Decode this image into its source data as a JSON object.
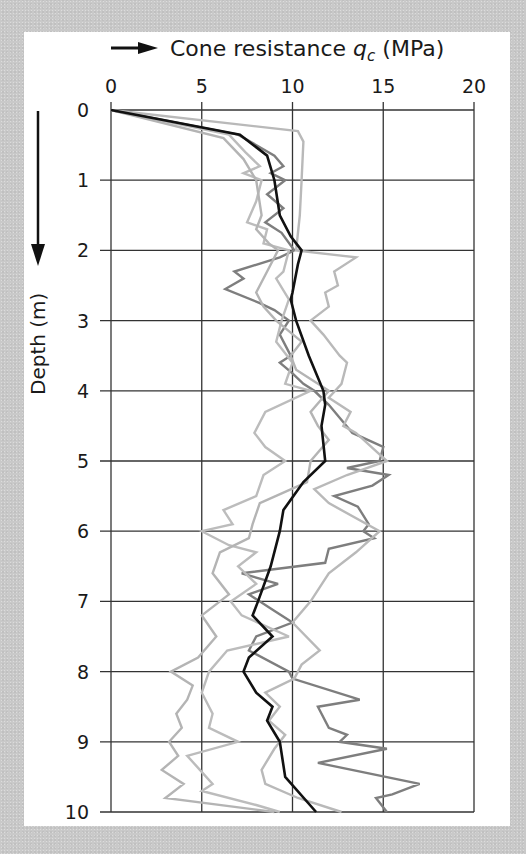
{
  "chart_data": {
    "type": "line",
    "title": "Cone resistance qc (MPa)",
    "title_parts": {
      "prefix": "Cone resistance ",
      "symbol": "q",
      "subscript": "c",
      "unit": " (MPa)"
    },
    "xlabel": "Cone resistance qc (MPa)",
    "ylabel": "Depth (m)",
    "x_axis_position": "top",
    "y_axis_inverted": true,
    "xlim": [
      0,
      20
    ],
    "ylim": [
      0,
      10
    ],
    "x_ticks": [
      "0",
      "5",
      "10",
      "15",
      "20"
    ],
    "y_ticks": [
      "0",
      "1",
      "2",
      "3",
      "4",
      "5",
      "6",
      "7",
      "8",
      "9",
      "10"
    ],
    "grid": true,
    "legend": null,
    "series": [
      {
        "name": "Mean profile",
        "color": "#111111",
        "width": 2.6,
        "points": [
          [
            0,
            0
          ],
          [
            7.1,
            0.35
          ],
          [
            8.6,
            0.65
          ],
          [
            9.0,
            1.0
          ],
          [
            9.3,
            1.5
          ],
          [
            9.9,
            1.8
          ],
          [
            10.5,
            2.0
          ],
          [
            10.3,
            2.2
          ],
          [
            10.0,
            2.6
          ],
          [
            9.9,
            2.7
          ],
          [
            10.2,
            3.0
          ],
          [
            10.9,
            3.5
          ],
          [
            11.7,
            4.0
          ],
          [
            11.8,
            4.2
          ],
          [
            11.6,
            4.5
          ],
          [
            11.8,
            5.0
          ],
          [
            10.6,
            5.3
          ],
          [
            9.5,
            5.7
          ],
          [
            9.3,
            6.0
          ],
          [
            8.8,
            6.5
          ],
          [
            8.1,
            7.0
          ],
          [
            7.8,
            7.2
          ],
          [
            8.9,
            7.5
          ],
          [
            7.6,
            7.8
          ],
          [
            7.3,
            8.0
          ],
          [
            8.0,
            8.3
          ],
          [
            8.9,
            8.5
          ],
          [
            8.6,
            8.7
          ],
          [
            9.3,
            9.0
          ],
          [
            9.6,
            9.5
          ],
          [
            11.3,
            10.0
          ]
        ]
      },
      {
        "name": "CPT profile A (dark grey)",
        "color": "#7e7e7e",
        "width": 2.4,
        "points": [
          [
            0,
            0
          ],
          [
            7.0,
            0.35
          ],
          [
            9.0,
            0.65
          ],
          [
            9.5,
            0.8
          ],
          [
            8.8,
            0.9
          ],
          [
            9.6,
            1.0
          ],
          [
            8.6,
            1.2
          ],
          [
            9.5,
            1.4
          ],
          [
            8.5,
            1.6
          ],
          [
            9.4,
            1.75
          ],
          [
            10.1,
            2.0
          ],
          [
            9.3,
            2.1
          ],
          [
            6.8,
            2.3
          ],
          [
            7.3,
            2.4
          ],
          [
            6.3,
            2.55
          ],
          [
            8.2,
            2.75
          ],
          [
            9.0,
            2.85
          ],
          [
            9.8,
            3.0
          ],
          [
            9.3,
            3.2
          ],
          [
            9.9,
            3.5
          ],
          [
            9.3,
            3.6
          ],
          [
            10.0,
            3.75
          ],
          [
            10.6,
            3.9
          ],
          [
            11.2,
            4.0
          ],
          [
            12.0,
            4.2
          ],
          [
            13.3,
            4.6
          ],
          [
            15.0,
            4.8
          ],
          [
            14.8,
            5.0
          ],
          [
            13.0,
            5.1
          ],
          [
            15.3,
            5.2
          ],
          [
            14.4,
            5.35
          ],
          [
            12.3,
            5.5
          ],
          [
            13.6,
            5.65
          ],
          [
            14.2,
            5.9
          ],
          [
            13.9,
            6.0
          ],
          [
            14.5,
            6.1
          ],
          [
            12.0,
            6.25
          ],
          [
            11.8,
            6.45
          ],
          [
            7.2,
            6.6
          ],
          [
            9.2,
            6.75
          ],
          [
            7.6,
            6.9
          ],
          [
            8.8,
            7.1
          ],
          [
            10.0,
            7.3
          ],
          [
            8.0,
            7.5
          ],
          [
            7.6,
            7.7
          ],
          [
            9.8,
            8.0
          ],
          [
            10.0,
            8.1
          ],
          [
            13.7,
            8.4
          ],
          [
            11.4,
            8.5
          ],
          [
            12.0,
            8.8
          ],
          [
            13.0,
            8.9
          ],
          [
            12.6,
            9.0
          ],
          [
            15.2,
            9.1
          ],
          [
            11.4,
            9.3
          ],
          [
            17.0,
            9.6
          ],
          [
            15.5,
            9.75
          ],
          [
            14.6,
            9.8
          ],
          [
            15.2,
            10.0
          ]
        ]
      },
      {
        "name": "CPT profile B (light grey)",
        "color": "#b9b9b9",
        "width": 2.4,
        "points": [
          [
            0,
            0
          ],
          [
            10.3,
            0.3
          ],
          [
            10.6,
            0.45
          ],
          [
            10.5,
            1.0
          ],
          [
            10.4,
            1.5
          ],
          [
            10.2,
            2.0
          ],
          [
            13.5,
            2.1
          ],
          [
            12.3,
            2.3
          ],
          [
            12.5,
            2.5
          ],
          [
            11.8,
            2.6
          ],
          [
            12.0,
            2.8
          ],
          [
            11.0,
            3.0
          ],
          [
            11.7,
            3.2
          ],
          [
            12.6,
            3.5
          ],
          [
            13.0,
            3.6
          ],
          [
            12.7,
            3.9
          ],
          [
            12.0,
            4.1
          ],
          [
            13.2,
            4.3
          ],
          [
            12.8,
            4.5
          ],
          [
            13.5,
            4.6
          ],
          [
            15.2,
            5.0
          ],
          [
            13.0,
            5.2
          ],
          [
            11.2,
            5.4
          ],
          [
            12.0,
            5.6
          ],
          [
            14.8,
            6.0
          ],
          [
            13.5,
            6.3
          ],
          [
            12.0,
            6.6
          ],
          [
            11.0,
            7.0
          ],
          [
            10.0,
            7.3
          ],
          [
            11.5,
            7.7
          ],
          [
            10.5,
            7.9
          ],
          [
            10.1,
            8.1
          ],
          [
            8.5,
            8.3
          ],
          [
            9.3,
            8.5
          ],
          [
            8.7,
            8.7
          ],
          [
            9.6,
            8.9
          ],
          [
            9.0,
            9.1
          ],
          [
            8.3,
            9.4
          ],
          [
            8.5,
            9.6
          ],
          [
            10.3,
            9.8
          ],
          [
            12.7,
            10.0
          ]
        ]
      },
      {
        "name": "CPT profile C (light grey)",
        "color": "#bcbcbc",
        "width": 2.4,
        "points": [
          [
            0,
            0
          ],
          [
            6.5,
            0.35
          ],
          [
            7.4,
            0.6
          ],
          [
            8.2,
            0.8
          ],
          [
            7.3,
            0.9
          ],
          [
            8.3,
            1.0
          ],
          [
            8.0,
            1.3
          ],
          [
            7.5,
            1.6
          ],
          [
            8.6,
            1.7
          ],
          [
            8.4,
            1.9
          ],
          [
            9.8,
            2.0
          ],
          [
            9.5,
            2.3
          ],
          [
            9.1,
            2.4
          ],
          [
            9.8,
            2.7
          ],
          [
            9.4,
            3.0
          ],
          [
            9.1,
            3.3
          ],
          [
            10.0,
            3.6
          ],
          [
            9.6,
            3.9
          ],
          [
            11.0,
            4.0
          ],
          [
            8.5,
            4.3
          ],
          [
            7.9,
            4.6
          ],
          [
            8.5,
            4.8
          ],
          [
            9.6,
            5.0
          ],
          [
            8.4,
            5.2
          ],
          [
            8.0,
            5.5
          ],
          [
            6.2,
            5.7
          ],
          [
            6.7,
            5.9
          ],
          [
            5.0,
            6.0
          ],
          [
            6.5,
            6.2
          ],
          [
            8.0,
            6.3
          ],
          [
            7.0,
            6.5
          ],
          [
            8.0,
            6.75
          ],
          [
            6.6,
            7.0
          ],
          [
            7.2,
            7.2
          ],
          [
            9.8,
            7.5
          ],
          [
            6.4,
            7.7
          ],
          [
            5.4,
            8.0
          ],
          [
            5.0,
            8.3
          ],
          [
            5.6,
            8.6
          ],
          [
            5.4,
            8.8
          ],
          [
            7.0,
            9.0
          ],
          [
            4.2,
            9.2
          ],
          [
            4.9,
            9.4
          ],
          [
            5.6,
            9.6
          ],
          [
            5.0,
            9.7
          ],
          [
            8.0,
            9.9
          ],
          [
            9.3,
            10.0
          ]
        ]
      },
      {
        "name": "CPT profile D (light grey)",
        "color": "#b4b4b4",
        "width": 2.4,
        "points": [
          [
            0,
            0
          ],
          [
            6.2,
            0.4
          ],
          [
            7.3,
            0.7
          ],
          [
            8.0,
            1.0
          ],
          [
            8.3,
            1.5
          ],
          [
            8.0,
            1.7
          ],
          [
            8.7,
            1.9
          ],
          [
            9.2,
            2.0
          ],
          [
            8.6,
            2.3
          ],
          [
            8.0,
            2.6
          ],
          [
            8.4,
            2.8
          ],
          [
            9.1,
            3.0
          ],
          [
            10.5,
            3.3
          ],
          [
            9.9,
            3.5
          ],
          [
            10.2,
            3.7
          ],
          [
            12.0,
            4.0
          ],
          [
            11.0,
            4.3
          ],
          [
            11.4,
            4.5
          ],
          [
            12.0,
            4.7
          ],
          [
            11.0,
            5.0
          ],
          [
            10.8,
            5.3
          ],
          [
            8.2,
            5.6
          ],
          [
            7.8,
            5.9
          ],
          [
            7.6,
            6.1
          ],
          [
            6.0,
            6.3
          ],
          [
            5.6,
            6.6
          ],
          [
            6.5,
            6.9
          ],
          [
            5.0,
            7.2
          ],
          [
            5.8,
            7.5
          ],
          [
            4.8,
            7.8
          ],
          [
            3.3,
            8.0
          ],
          [
            4.5,
            8.2
          ],
          [
            4.2,
            8.4
          ],
          [
            3.6,
            8.6
          ],
          [
            3.9,
            8.8
          ],
          [
            3.2,
            9.0
          ],
          [
            3.7,
            9.2
          ],
          [
            2.8,
            9.4
          ],
          [
            4.0,
            9.6
          ],
          [
            3.0,
            9.8
          ],
          [
            9.0,
            10.0
          ]
        ]
      }
    ]
  }
}
